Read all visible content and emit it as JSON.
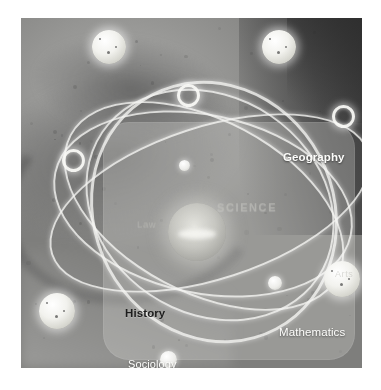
{
  "image": {
    "title": "Atom network diagram of academic subjects",
    "media_type": "photographic-illustration",
    "palette": {
      "background": "#ffffff",
      "photo_base": "#8d8d8d",
      "photo_dark": "#3b3b3b",
      "orbit_stroke": "#f5f5f2",
      "node_fill": "#ffffff",
      "panel_overlay": "rgba(214,214,212,0.30)",
      "label_light": "#fdfdfb",
      "label_dark": "#1d1d1d",
      "label_ghost": "#bcbcb6"
    }
  },
  "panel": {
    "name": "translucent-overlay-panel",
    "shape": "rounded-rectangle"
  },
  "labels": [
    {
      "id": "geography",
      "text": "Geography",
      "style": "white",
      "x": 262,
      "y": 133,
      "size": 11.5
    },
    {
      "id": "mathematics",
      "text": "Mathematics",
      "style": "white reg",
      "x": 258,
      "y": 308,
      "size": 11.5
    },
    {
      "id": "history",
      "text": "History",
      "style": "dark",
      "x": 104,
      "y": 289,
      "size": 11.5
    },
    {
      "id": "sociology",
      "text": "Sociology",
      "style": "white reg",
      "x": 107,
      "y": 340,
      "size": 11
    },
    {
      "id": "science",
      "text": "SCIENCE",
      "style": "ghost",
      "x": 196,
      "y": 183,
      "size": 11
    },
    {
      "id": "law",
      "text": "Law",
      "style": "ghost sm",
      "x": 116,
      "y": 200,
      "size": 9.5
    },
    {
      "id": "arts",
      "text": "Arts",
      "style": "ghost sm",
      "x": 314,
      "y": 251,
      "size": 9
    }
  ],
  "nodes": [
    {
      "id": "node-top-left",
      "kind": "sphere",
      "x": 71,
      "y": 12,
      "size": 34
    },
    {
      "id": "node-top-right",
      "kind": "sphere",
      "x": 241,
      "y": 12,
      "size": 34
    },
    {
      "id": "node-upper-mid",
      "kind": "ring",
      "x": 156,
      "y": 66,
      "size": 17
    },
    {
      "id": "node-right-edge",
      "kind": "ring",
      "x": 311,
      "y": 87,
      "size": 17
    },
    {
      "id": "node-left-mid",
      "kind": "ring",
      "x": 41,
      "y": 131,
      "size": 17
    },
    {
      "id": "node-inner-small",
      "kind": "small",
      "x": 158,
      "y": 142,
      "size": 11
    },
    {
      "id": "node-right-large",
      "kind": "sphere",
      "x": 303,
      "y": 243,
      "size": 36
    },
    {
      "id": "node-mid-small",
      "kind": "small",
      "x": 247,
      "y": 258,
      "size": 14
    },
    {
      "id": "node-bottom-left",
      "kind": "sphere",
      "x": 18,
      "y": 275,
      "size": 36
    },
    {
      "id": "node-bottom-center",
      "kind": "small",
      "x": 139,
      "y": 333,
      "size": 17
    },
    {
      "id": "node-nucleus",
      "kind": "nucleus",
      "x": 147,
      "y": 185,
      "size": 58
    }
  ],
  "orbits": [
    {
      "id": "orbit-1",
      "rotate": -28,
      "x": 72,
      "y": 60,
      "w": 236,
      "h": 262,
      "weight": "thick"
    },
    {
      "id": "orbit-2",
      "rotate": 34,
      "x": 58,
      "y": 78,
      "w": 258,
      "h": 214,
      "weight": "thin"
    },
    {
      "id": "orbit-3",
      "rotate": -62,
      "x": 96,
      "y": 36,
      "w": 170,
      "h": 300,
      "weight": "thin"
    },
    {
      "id": "orbit-4",
      "rotate": 12,
      "x": 30,
      "y": 96,
      "w": 300,
      "h": 176,
      "weight": "thin"
    },
    {
      "id": "orbit-5",
      "rotate": 72,
      "x": 112,
      "y": 18,
      "w": 150,
      "h": 330,
      "weight": "thin"
    }
  ]
}
